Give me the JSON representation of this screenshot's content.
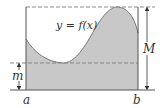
{
  "diagram": {
    "curve_label": "y = f(x)",
    "left_bound_label": "a",
    "right_bound_label": "b",
    "max_label": "M",
    "min_label": "m",
    "colors": {
      "fill": "#c8c8c8",
      "stroke": "#555555",
      "dashed": "#808080",
      "text": "#333333"
    },
    "elements": [
      "shaded region under curve y = f(x) from a to b",
      "dashed horizontal line at maximum M",
      "dashed horizontal line at minimum m",
      "double-headed arrow indicating height M",
      "double-headed arrow indicating height m",
      "rectangle from a to b with height M"
    ]
  }
}
